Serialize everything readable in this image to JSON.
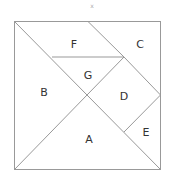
{
  "figure": {
    "top_mark": "x",
    "pieces": [
      {
        "id": "A",
        "label": "A",
        "x": 89,
        "y": 139
      },
      {
        "id": "B",
        "label": "B",
        "x": 44,
        "y": 92
      },
      {
        "id": "C",
        "label": "C",
        "x": 140,
        "y": 44
      },
      {
        "id": "D",
        "label": "D",
        "x": 124,
        "y": 96
      },
      {
        "id": "E",
        "label": "E",
        "x": 146,
        "y": 132
      },
      {
        "id": "F",
        "label": "F",
        "x": 74,
        "y": 44
      },
      {
        "id": "G",
        "label": "G",
        "x": 88,
        "y": 75
      }
    ],
    "stroke_color": "#999999"
  }
}
